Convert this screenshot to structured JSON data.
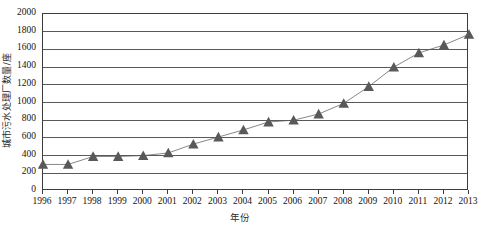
{
  "chart_data": {
    "type": "line",
    "title": "",
    "xlabel": "年份",
    "ylabel": "城市污水处理厂数量/座",
    "categories": [
      "1996",
      "1997",
      "1998",
      "1999",
      "2000",
      "2001",
      "2002",
      "2003",
      "2004",
      "2005",
      "2006",
      "2007",
      "2008",
      "2009",
      "2010",
      "2011",
      "2012",
      "2013"
    ],
    "x": [
      1996,
      1997,
      1998,
      1999,
      2000,
      2001,
      2002,
      2003,
      2004,
      2005,
      2006,
      2007,
      2008,
      2009,
      2010,
      2011,
      2012,
      2013
    ],
    "values": [
      300,
      300,
      390,
      390,
      400,
      430,
      530,
      610,
      690,
      780,
      800,
      870,
      990,
      1180,
      1400,
      1560,
      1650,
      1770
    ],
    "series": [
      {
        "name": "城市污水处理厂数量",
        "values": [
          300,
          300,
          390,
          390,
          400,
          430,
          530,
          610,
          690,
          780,
          800,
          870,
          990,
          1180,
          1400,
          1560,
          1650,
          1770
        ],
        "marker": "triangle",
        "marker_color": "#595959",
        "line_color": "#7a7a7a"
      }
    ],
    "ylim": [
      0,
      2000
    ],
    "yticks": [
      0,
      200,
      400,
      600,
      800,
      1000,
      1200,
      1400,
      1600,
      1800,
      2000
    ],
    "ytick_labels": [
      "0",
      "200",
      "400",
      "600",
      "800",
      "1000",
      "1200",
      "1400",
      "1600",
      "1800",
      "2000"
    ],
    "xlim": [
      1996,
      2013
    ],
    "grid": "horizontal",
    "legend": "none"
  },
  "axis": {
    "y_title": "城市污水处理厂数量/座",
    "x_title": "年份"
  },
  "colors": {
    "marker": "#595959",
    "line": "#7a7a7a",
    "grid": "#595959",
    "frame": "#3c3c3c",
    "background": "#ffffff"
  }
}
